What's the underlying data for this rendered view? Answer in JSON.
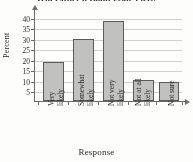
{
  "figure": {
    "title": "Will Either a Bond Issue Pass?",
    "title_clipped": true
  },
  "chart_data": {
    "type": "bar",
    "title": "Will Either a Bond Issue Pass?",
    "xlabel": "Response",
    "ylabel": "Percent",
    "categories": [
      "Very likely",
      "Somewhat likely",
      "Not very likely",
      "Not at all likely",
      "Not sure"
    ],
    "category_lines": [
      [
        "Very",
        "likely"
      ],
      [
        "Somewhat",
        "likely"
      ],
      [
        "Not very",
        "likely"
      ],
      [
        "Not at all",
        "likely"
      ],
      [
        "Not sure"
      ]
    ],
    "values": [
      18.5,
      29.5,
      38,
      10,
      9
    ],
    "ylim": [
      0,
      42
    ],
    "yticks": [
      5,
      10,
      15,
      20,
      25,
      30,
      35,
      40
    ],
    "ytick_labels": [
      "5",
      "10",
      "15",
      "20",
      "25",
      "30",
      "35",
      "40"
    ],
    "grid": true,
    "grid_axis": "y",
    "legend": false,
    "bar_fill": "#c2c2c0",
    "bar_edge": "#58585a",
    "grid_color": "#d2d2d0",
    "axis_color": "#6a6a6a"
  }
}
